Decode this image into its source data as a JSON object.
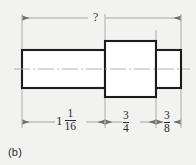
{
  "figure": {
    "caption": "(b)",
    "type": "stepped-shaft-front-view",
    "background_color": "#f2f2f0",
    "outline_color": "#1c1c1c",
    "dimension_line_color": "#8f8f8f"
  },
  "overall_dimension": {
    "label": "?",
    "position": "top",
    "known": false
  },
  "dimensions": [
    {
      "id": "left-shaft-length",
      "whole": "1",
      "numerator": "1",
      "denominator": "16",
      "display": "1 1/16"
    },
    {
      "id": "center-flange-length",
      "whole": "",
      "numerator": "3",
      "denominator": "4",
      "display": "3/4"
    },
    {
      "id": "right-shaft-length",
      "whole": "",
      "numerator": "3",
      "denominator": "8",
      "display": "3/8"
    }
  ],
  "icons": {
    "arrow_left": "arrow-left-icon",
    "arrow_right": "arrow-right-icon",
    "centerline": "centerline-icon"
  }
}
